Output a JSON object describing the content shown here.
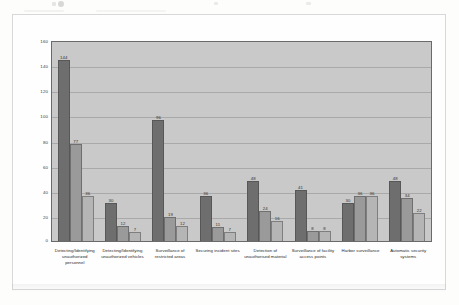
{
  "page": {
    "background_color": "#fdfdfc",
    "frame_border_color": "#d8d8d8"
  },
  "chart_data": {
    "type": "bar",
    "title": "",
    "subtitle": "",
    "xlabel": "",
    "ylabel": "",
    "ylim": [
      0,
      160
    ],
    "yticks": [
      0,
      20,
      40,
      60,
      80,
      100,
      120,
      140,
      160
    ],
    "ytick_labels": [
      "0",
      "20",
      "40",
      "60",
      "80",
      "100",
      "120",
      "140",
      "160"
    ],
    "grid": true,
    "grid_axis": "y",
    "legend": false,
    "legend_position": "none",
    "plot_background_color": "#c9c9c9",
    "categories": [
      "Detecting/Identifying unauthorized personnel",
      "Detecting/Identifying unauthorized vehicles",
      "Surveillance of restricted areas",
      "Securing incident sites",
      "Detection of unauthorised material",
      "Surveillance of facility access points",
      "Harbor surveillance",
      "Automatic security systems"
    ],
    "series": [
      {
        "name": "Series 1",
        "color": "#6e6e6e",
        "values": [
          144,
          30,
          96,
          36,
          48,
          41,
          30,
          48
        ]
      },
      {
        "name": "Series 2",
        "color": "#9a9a9a",
        "values": [
          77,
          12,
          19,
          11,
          24,
          8,
          36,
          34
        ]
      },
      {
        "name": "Series 3",
        "color": "#b5b5b5",
        "values": [
          36,
          7,
          12,
          7,
          16,
          8,
          36,
          22
        ]
      }
    ],
    "data_labels": [
      [
        "144",
        "77",
        "36"
      ],
      [
        "30",
        "12",
        "7"
      ],
      [
        "96",
        "19",
        "12"
      ],
      [
        "36",
        "11",
        "7"
      ],
      [
        "48",
        "24",
        "16"
      ],
      [
        "41",
        "8",
        "8"
      ],
      [
        "30",
        "36",
        "36"
      ],
      [
        "48",
        "34",
        "22"
      ]
    ]
  }
}
